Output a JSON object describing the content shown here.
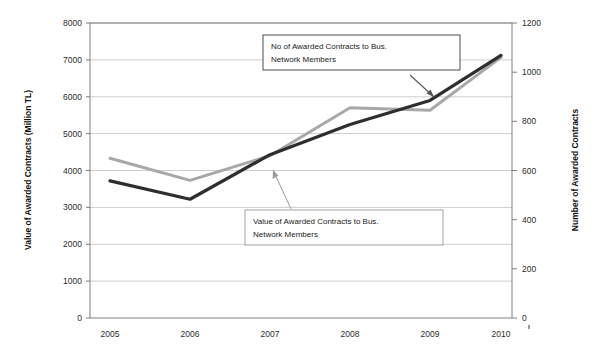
{
  "chart_data": {
    "type": "line",
    "title": "",
    "xlabel": "",
    "categories": [
      "2005",
      "2006",
      "2007",
      "2008",
      "2009",
      "2010"
    ],
    "grid": true,
    "legend_position": "none",
    "axes": {
      "left": {
        "label": "Value of Awarded Contracts (Million TL)",
        "ylim": [
          0,
          8000
        ],
        "ticks": [
          "0",
          "1000",
          "2000",
          "3000",
          "4000",
          "5000",
          "6000",
          "7000",
          "8000"
        ],
        "tick_values": [
          0,
          1000,
          2000,
          3000,
          4000,
          5000,
          6000,
          7000,
          8000
        ]
      },
      "right": {
        "label": "Number of Awarded Contracts",
        "ylim": [
          0,
          1200
        ],
        "ticks": [
          "0",
          "200",
          "400",
          "600",
          "800",
          "1000",
          "1200"
        ],
        "tick_values": [
          0,
          200,
          400,
          600,
          800,
          1000,
          1200
        ]
      }
    },
    "series": [
      {
        "name": "Value of Awarded Contracts to Bus. Network Members",
        "axis": "left",
        "color": "#2e2e2e",
        "width": 3.2,
        "values": [
          3720,
          3220,
          4430,
          5250,
          5900,
          7120
        ]
      },
      {
        "name": "No of Awarded Contracts to Bus. Network Members",
        "axis": "right",
        "color": "#a8a8a8",
        "width": 3.0,
        "values": [
          650,
          560,
          660,
          855,
          845,
          1060
        ]
      }
    ],
    "annotations": [
      {
        "id": "contracts-count-callout",
        "line1": "No of Awarded Contracts to Bus.",
        "line2": "Network Members"
      },
      {
        "id": "contracts-value-callout",
        "line1": "Value of Awarded Contracts to Bus.",
        "line2": "Network Members"
      }
    ]
  }
}
